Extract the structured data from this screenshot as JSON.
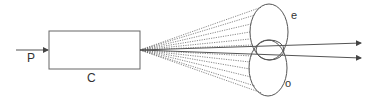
{
  "diagram": {
    "labels": {
      "input": "P",
      "box": "C",
      "upper_ellipse": "e",
      "lower_ellipse": "o"
    },
    "colors": {
      "stroke": "#555555",
      "text": "#333333",
      "background": "#ffffff"
    }
  }
}
